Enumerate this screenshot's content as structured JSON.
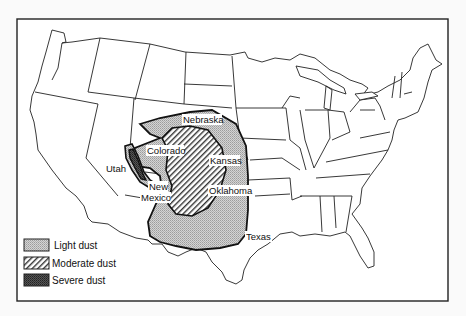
{
  "map": {
    "title": "",
    "region": "Contiguous United States",
    "state_labels": [
      {
        "name": "Utah",
        "x": 107,
        "y": 171
      },
      {
        "name": "Colorado",
        "x": 148,
        "y": 153
      },
      {
        "name": "Nebraska",
        "x": 184,
        "y": 122
      },
      {
        "name": "Kansas",
        "x": 211,
        "y": 163
      },
      {
        "name": "New",
        "x": 150,
        "y": 189
      },
      {
        "name": "Mexico",
        "x": 141,
        "y": 200
      },
      {
        "name": "Oklahoma",
        "x": 209,
        "y": 193
      },
      {
        "name": "Texas",
        "x": 246,
        "y": 239
      }
    ],
    "colors": {
      "outline": "#222222",
      "light_fill": "#c8c8c8",
      "moderate_fill": "#9a9a9a",
      "severe_fill": "#4a4a4a",
      "background": "#ffffff"
    }
  },
  "legend": {
    "items": [
      {
        "key": "light",
        "label": "Light dust"
      },
      {
        "key": "moderate",
        "label": "Moderate dust"
      },
      {
        "key": "severe",
        "label": "Severe dust"
      }
    ]
  }
}
